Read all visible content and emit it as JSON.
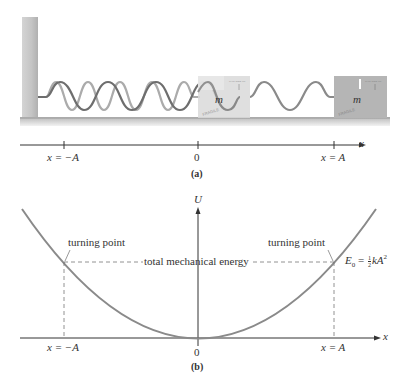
{
  "panel_a": {
    "caption": "(a)",
    "block_label": "m",
    "block_sticker_text": "FRAGILE",
    "block_arrow_text": "THIS SIDE UP",
    "axis_label": "x",
    "ticks": [
      {
        "label": "x = −A",
        "pos": "-A"
      },
      {
        "label": "0",
        "pos": "0"
      },
      {
        "label": "x = A",
        "pos": "A"
      }
    ]
  },
  "panel_b": {
    "caption": "(b)",
    "y_axis_label": "U",
    "x_axis_label": "x",
    "left_annotation": "turning point",
    "right_annotation": "turning point",
    "energy_label": "total mechanical energy",
    "energy_formula": {
      "E": "E",
      "sub": "0",
      "eq": " = ",
      "num": "1",
      "den": "2",
      "rest": "kA",
      "sup": "2"
    },
    "ticks": [
      {
        "label": "x = −A",
        "pos": "-A"
      },
      {
        "label": "0",
        "pos": "0"
      },
      {
        "label": "x = A",
        "pos": "A"
      }
    ]
  },
  "colors": {
    "curve": "#8a8a8a",
    "spring_dark": "#6a6a6a",
    "spring_light": "#a9a9a9",
    "block": "#b3b3b3",
    "wall": "#c8c8c8",
    "axis": "#333333"
  }
}
